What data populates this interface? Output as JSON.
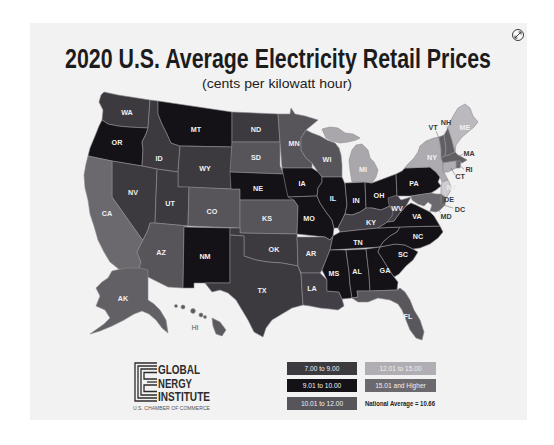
{
  "title": "2020 U.S. Average Electricity Retail Prices",
  "subtitle": "(cents per kilowatt hour)",
  "expand_button": {
    "icon": "expand-icon"
  },
  "map": {
    "type": "choropleth",
    "units": "cents per kilowatt hour",
    "states": {
      "WA": {
        "label": "WA",
        "range": "7.00 to 9.00",
        "fill": "#3c393f"
      },
      "OR": {
        "label": "OR",
        "range": "9.01 to 10.00",
        "fill": "#141216"
      },
      "CA": {
        "label": "CA",
        "range": "15.01 and Higher",
        "fill": "#6b686e"
      },
      "ID": {
        "label": "ID",
        "range": "7.00 to 9.00",
        "fill": "#3c393f"
      },
      "NV": {
        "label": "NV",
        "range": "7.00 to 9.00",
        "fill": "#3c393f"
      },
      "MT": {
        "label": "MT",
        "range": "9.01 to 10.00",
        "fill": "#141216"
      },
      "WY": {
        "label": "WY",
        "range": "7.00 to 9.00",
        "fill": "#3c393f"
      },
      "UT": {
        "label": "UT",
        "range": "7.00 to 9.00",
        "fill": "#3c393f"
      },
      "CO": {
        "label": "CO",
        "range": "10.01 to 12.00",
        "fill": "#57545a"
      },
      "AZ": {
        "label": "AZ",
        "range": "10.01 to 12.00",
        "fill": "#57545a"
      },
      "NM": {
        "label": "NM",
        "range": "9.01 to 10.00",
        "fill": "#141216"
      },
      "ND": {
        "label": "ND",
        "range": "7.00 to 9.00",
        "fill": "#3c393f"
      },
      "SD": {
        "label": "SD",
        "range": "10.01 to 12.00",
        "fill": "#57545a"
      },
      "NE": {
        "label": "NE",
        "range": "9.01 to 10.00",
        "fill": "#141216"
      },
      "KS": {
        "label": "KS",
        "range": "10.01 to 12.00",
        "fill": "#57545a"
      },
      "OK": {
        "label": "OK",
        "range": "7.00 to 9.00",
        "fill": "#3c393f"
      },
      "TX": {
        "label": "TX",
        "range": "7.00 to 9.00",
        "fill": "#3c393f"
      },
      "MN": {
        "label": "MN",
        "range": "10.01 to 12.00",
        "fill": "#57545a"
      },
      "IA": {
        "label": "IA",
        "range": "9.01 to 10.00",
        "fill": "#141216"
      },
      "MO": {
        "label": "MO",
        "range": "9.01 to 10.00",
        "fill": "#141216"
      },
      "AR": {
        "label": "AR",
        "range": "7.00 to 9.00",
        "fill": "#423f45"
      },
      "LA": {
        "label": "LA",
        "range": "7.00 to 9.00",
        "fill": "#433f46"
      },
      "WI": {
        "label": "WI",
        "range": "10.01 to 12.00",
        "fill": "#57545a"
      },
      "IL": {
        "label": "IL",
        "range": "9.01 to 10.00",
        "fill": "#141216"
      },
      "MI": {
        "label": "MI",
        "range": "12.01 to 15.00",
        "fill": "#aaa7ac"
      },
      "IN": {
        "label": "IN",
        "range": "9.01 to 10.00",
        "fill": "#141216"
      },
      "OH": {
        "label": "OH",
        "range": "9.01 to 10.00",
        "fill": "#141216"
      },
      "KY": {
        "label": "KY",
        "range": "7.00 to 9.00",
        "fill": "#433f46"
      },
      "TN": {
        "label": "TN",
        "range": "9.01 to 10.00",
        "fill": "#141216"
      },
      "MS": {
        "label": "MS",
        "range": "9.01 to 10.00",
        "fill": "#141216"
      },
      "AL": {
        "label": "AL",
        "range": "9.01 to 10.00",
        "fill": "#141216"
      },
      "GA": {
        "label": "GA",
        "range": "9.01 to 10.00",
        "fill": "#141216"
      },
      "FL": {
        "label": "FL",
        "range": "10.01 to 12.00",
        "fill": "#59565c"
      },
      "SC": {
        "label": "SC",
        "range": "9.01 to 10.00",
        "fill": "#141216"
      },
      "NC": {
        "label": "NC",
        "range": "9.01 to 10.00",
        "fill": "#141216"
      },
      "VA": {
        "label": "VA",
        "range": "9.01 to 10.00",
        "fill": "#141216"
      },
      "WV": {
        "label": "WV",
        "range": "7.00 to 9.00",
        "fill": "#433f46"
      },
      "PA": {
        "label": "PA",
        "range": "9.01 to 10.00",
        "fill": "#141216"
      },
      "NY": {
        "label": "NY",
        "range": "12.01 to 15.00",
        "fill": "#aeabb0"
      },
      "VT": {
        "label": "VT",
        "range": "15.01 and Higher",
        "fill": "#615e64"
      },
      "NH": {
        "label": "NH",
        "range": "15.01 and Higher",
        "fill": "#615e64"
      },
      "ME": {
        "label": "ME",
        "range": "12.01 to 15.00",
        "fill": "#bcb9be"
      },
      "MA": {
        "label": "MA",
        "range": "15.01 and Higher",
        "fill": "#615e64"
      },
      "RI": {
        "label": "RI",
        "range": "15.01 and Higher",
        "fill": "#6b686e"
      },
      "CT": {
        "label": "CT",
        "range": "12.01 to 15.00",
        "fill": "#b1aeb3"
      },
      "NJ": {
        "label": "NJ",
        "range": "12.01 to 15.00",
        "fill": "#cfccd1"
      },
      "DE": {
        "label": "DE",
        "range": "15.01 and Higher",
        "fill": "#615e64"
      },
      "MD": {
        "label": "MD",
        "range": "15.01 and Higher",
        "fill": "#6b686e"
      },
      "DC": {
        "label": "DC"
      },
      "AK": {
        "label": "AK",
        "range": "15.01 and Higher",
        "fill": "#625f65"
      },
      "HI": {
        "label": "HI",
        "range": "15.01 and Higher",
        "fill": "#5c595f"
      }
    }
  },
  "legend": {
    "items": [
      {
        "label": "7.00 to 9.00",
        "color": "#3c393f"
      },
      {
        "label": "9.01 to 10.00",
        "color": "#141216"
      },
      {
        "label": "10.01 to 12.00",
        "color": "#57545a"
      },
      {
        "label": "12.01 to 15.00",
        "color": "#b1aeb3"
      },
      {
        "label": "15.01 and Higher",
        "color": "#6b686e"
      }
    ],
    "national_average": "National Average = 10.66"
  },
  "logo": {
    "line1": "GLOBAL",
    "line2": "NERGY",
    "line3": "INSTITUTE",
    "tagline": "U.S. CHAMBER OF COMMERCE"
  }
}
